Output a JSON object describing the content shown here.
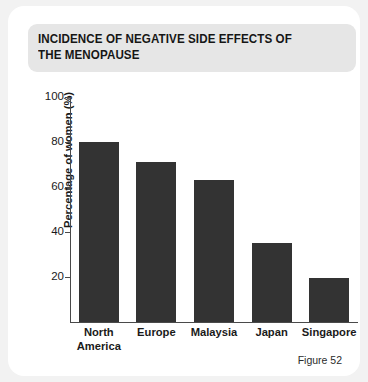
{
  "card": {
    "background_color": "#ffffff",
    "page_background_color": "#f2f2f2"
  },
  "title_band": {
    "background_color": "#e6e6e6"
  },
  "figure_caption": "Figure 52",
  "chart_data": {
    "type": "bar",
    "title": "INCIDENCE OF NEGATIVE SIDE EFFECTS OF\nTHE MENOPAUSE",
    "categories": [
      "North\nAmerica",
      "Europe",
      "Malaysia",
      "Japan",
      "Singapore"
    ],
    "values": [
      80,
      71,
      63,
      35,
      19.5
    ],
    "xlabel": "",
    "ylabel": "Percentage of women (%)",
    "ylim": [
      0,
      100
    ],
    "yticks": [
      100,
      80,
      60,
      40,
      20
    ],
    "ytick_labels": [
      "100",
      "80",
      "60",
      "40",
      "20"
    ],
    "grid": false,
    "legend": false,
    "bar_color": "#333333",
    "axis_color": "#4a4a4a"
  }
}
